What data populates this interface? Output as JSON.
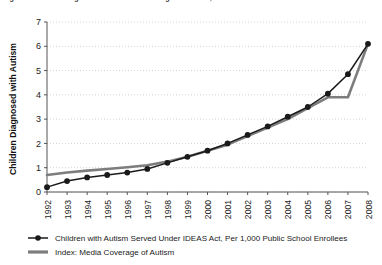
{
  "title": {
    "text": "Figure 1. Autism Diagnoses and Media Coverage of Autism, 1992-2008",
    "clipped": true
  },
  "chart_data": {
    "type": "line",
    "title": "Figure 1. Autism Diagnoses and Media Coverage of Autism, 1992-2008",
    "xlabel": "",
    "ylabel": "Children Diagnosed with Autism",
    "ylim": [
      0,
      7
    ],
    "yticks": [
      0,
      1,
      2,
      3,
      4,
      5,
      6,
      7
    ],
    "grid": "horizontal-dotted",
    "legend_position": "bottom-left",
    "x": [
      1992,
      1993,
      1994,
      1995,
      1996,
      1997,
      1998,
      1999,
      2000,
      2001,
      2002,
      2003,
      2004,
      2005,
      2006,
      2007,
      2008
    ],
    "categories": [
      "1992",
      "1993",
      "1994",
      "1995",
      "1996",
      "1997",
      "1998",
      "1999",
      "2000",
      "2001",
      "2002",
      "2003",
      "2004",
      "2005",
      "2006",
      "2007",
      "2008"
    ],
    "series": [
      {
        "name": "Children with Autism Served Under IDEAS Act, Per 1,000 Public School Enrollees",
        "marker": "circle",
        "color": "#1a1a1a",
        "values": [
          0.2,
          0.45,
          0.6,
          0.7,
          0.8,
          0.95,
          1.2,
          1.45,
          1.7,
          2.0,
          2.35,
          2.7,
          3.1,
          3.5,
          4.05,
          4.85,
          6.1
        ]
      },
      {
        "name": "Index: Media Coverage of Autism",
        "marker": "none",
        "color": "#7d7d7d",
        "values": [
          0.7,
          0.8,
          0.88,
          0.95,
          1.02,
          1.1,
          1.25,
          1.45,
          1.7,
          1.95,
          2.3,
          2.65,
          3.0,
          3.45,
          3.9,
          3.9,
          6.1
        ]
      }
    ]
  },
  "legend": {
    "items": [
      {
        "label": "Children with Autism Served Under IDEAS Act, Per 1,000 Public School Enrollees",
        "style": "line-with-marker",
        "color": "#1a1a1a"
      },
      {
        "label": "Index: Media Coverage of Autism",
        "style": "thick-line",
        "color": "#7d7d7d"
      }
    ]
  },
  "colors": {
    "series_primary": "#1a1a1a",
    "series_secondary": "#7d7d7d",
    "gridline": "#c9c9c9",
    "axis": "#555555",
    "background": "#ffffff"
  }
}
